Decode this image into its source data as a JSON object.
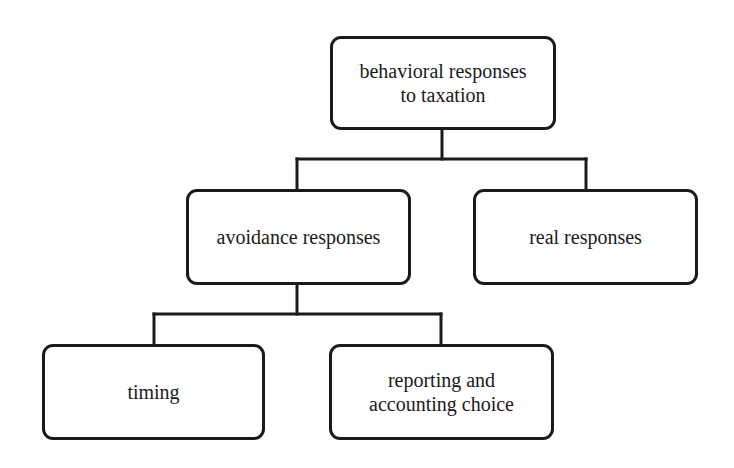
{
  "diagram": {
    "type": "tree",
    "title": "",
    "colors": {
      "stroke": "#1a1a1a",
      "fill": "#ffffff",
      "text": "#1a1a1a"
    },
    "nodes": {
      "root": {
        "label": "behavioral responses\nto taxation",
        "children": [
          "avoidance",
          "real"
        ]
      },
      "avoidance": {
        "label": "avoidance responses",
        "children": [
          "timing",
          "reporting"
        ]
      },
      "real": {
        "label": "real responses",
        "children": []
      },
      "timing": {
        "label": "timing",
        "children": []
      },
      "reporting": {
        "label": "reporting and\naccounting choice",
        "children": []
      }
    },
    "edges": [
      {
        "from": "root",
        "to": "avoidance"
      },
      {
        "from": "root",
        "to": "real"
      },
      {
        "from": "avoidance",
        "to": "timing"
      },
      {
        "from": "avoidance",
        "to": "reporting"
      }
    ]
  }
}
